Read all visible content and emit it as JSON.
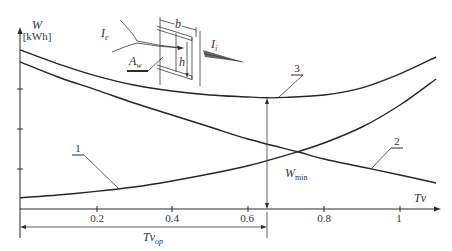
{
  "figure": {
    "y_axis": {
      "symbol": "W",
      "unit": "[kWh]"
    },
    "x_axis": {
      "symbol": "Tv",
      "ticks": [
        "0.2",
        "0.4",
        "0.6",
        "0.8",
        "1"
      ]
    },
    "curve_labels": {
      "c1": "1",
      "c2": "2",
      "c3": "3"
    },
    "annotations": {
      "w_min": {
        "main": "W",
        "sub": "min"
      },
      "tv_op": {
        "main": "Tv",
        "sub": "op"
      }
    },
    "inset": {
      "flow_in": {
        "main": "I",
        "sub": "e"
      },
      "flow_out": {
        "main": "I",
        "sub": "i"
      },
      "area": {
        "main": "A",
        "sub": "w"
      },
      "width_label": "b",
      "height_label": "h"
    },
    "colors": {
      "line": "#262626",
      "background": "#ffffff",
      "flow_arrow": "#666666"
    }
  },
  "chart_data": {
    "type": "line",
    "title": "",
    "xlabel": "Tv",
    "ylabel": "W [kWh]",
    "xlim": [
      0,
      1.1
    ],
    "ylim": [
      0,
      4.5
    ],
    "x_ticks": [
      0.2,
      0.4,
      0.6,
      0.8,
      1
    ],
    "y_ticks": [
      1,
      2,
      3
    ],
    "y_tick_labels_shown": false,
    "grid": false,
    "legend": "numbered leader labels on curves",
    "series": [
      {
        "name": "1",
        "x": [
          0,
          0.1,
          0.2,
          0.3,
          0.4,
          0.5,
          0.6,
          0.73,
          0.8,
          0.9,
          1.0,
          1.095
        ],
        "y": [
          0.28,
          0.35,
          0.44,
          0.55,
          0.7,
          0.88,
          1.08,
          1.43,
          1.65,
          2.05,
          2.6,
          3.25
        ]
      },
      {
        "name": "2",
        "x": [
          0,
          0.1,
          0.2,
          0.3,
          0.4,
          0.5,
          0.6,
          0.73,
          0.8,
          0.9,
          1.0,
          1.095
        ],
        "y": [
          3.68,
          3.3,
          2.98,
          2.65,
          2.35,
          2.05,
          1.75,
          1.43,
          1.25,
          1.05,
          0.85,
          0.65
        ]
      },
      {
        "name": "3",
        "x": [
          0,
          0.1,
          0.2,
          0.3,
          0.4,
          0.5,
          0.6,
          0.65,
          0.7,
          0.8,
          0.9,
          1.0,
          1.095
        ],
        "y": [
          3.98,
          3.63,
          3.33,
          3.1,
          2.95,
          2.85,
          2.8,
          2.78,
          2.79,
          2.85,
          3.03,
          3.38,
          3.8
        ]
      }
    ],
    "annotations": [
      {
        "text": "W_min",
        "x": 0.65,
        "y": 2.78
      },
      {
        "text": "Tv_op",
        "x": 0.65
      }
    ]
  }
}
